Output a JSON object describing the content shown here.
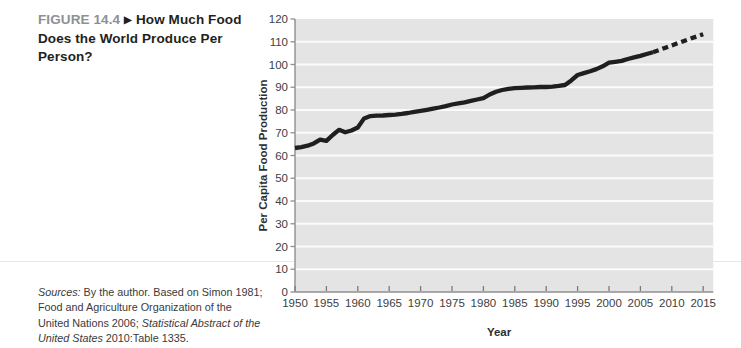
{
  "figure": {
    "label": "FIGURE 14.4",
    "arrow": "▶",
    "title": "How Much Food Does the World Produce Per Person?"
  },
  "sources": {
    "label_italic": "Sources:",
    "text_1": " By the author. Based on Simon 1981; Food and Agriculture Organization of the United Nations 2006; ",
    "italic_title": "Statistical Abstract of the United States",
    "text_2": " 2010:Table 1335."
  },
  "chart_data": {
    "type": "line",
    "title": "",
    "xlabel": "Year",
    "ylabel": "Per Capita Food Production",
    "xlim": [
      1950,
      2016.6
    ],
    "ylim": [
      0,
      120
    ],
    "x_ticks": [
      1950,
      1955,
      1960,
      1965,
      1970,
      1975,
      1980,
      1985,
      1990,
      1995,
      2000,
      2005,
      2010,
      2015
    ],
    "y_ticks": [
      0,
      10,
      20,
      30,
      40,
      50,
      60,
      70,
      80,
      90,
      100,
      110,
      120
    ],
    "grid": "horizontal white gridlines on light-gray plot band",
    "legend": "none",
    "series": [
      {
        "name": "historical",
        "style": "solid",
        "points": [
          [
            1950,
            63.3
          ],
          [
            1951,
            63.7
          ],
          [
            1952,
            64.3
          ],
          [
            1953,
            65.3
          ],
          [
            1954,
            67.0
          ],
          [
            1955,
            66.4
          ],
          [
            1956,
            69.0
          ],
          [
            1957,
            71.3
          ],
          [
            1958,
            70.2
          ],
          [
            1959,
            71.0
          ],
          [
            1960,
            72.3
          ],
          [
            1961,
            76.3
          ],
          [
            1962,
            77.3
          ],
          [
            1963,
            77.5
          ],
          [
            1964,
            77.6
          ],
          [
            1965,
            77.8
          ],
          [
            1966,
            78.0
          ],
          [
            1967,
            78.3
          ],
          [
            1968,
            78.7
          ],
          [
            1969,
            79.2
          ],
          [
            1970,
            79.6
          ],
          [
            1971,
            80.1
          ],
          [
            1972,
            80.6
          ],
          [
            1973,
            81.1
          ],
          [
            1974,
            81.7
          ],
          [
            1975,
            82.4
          ],
          [
            1976,
            82.9
          ],
          [
            1977,
            83.4
          ],
          [
            1978,
            84.0
          ],
          [
            1979,
            84.6
          ],
          [
            1980,
            85.2
          ],
          [
            1981,
            86.8
          ],
          [
            1982,
            88.0
          ],
          [
            1983,
            88.8
          ],
          [
            1984,
            89.3
          ],
          [
            1985,
            89.6
          ],
          [
            1986,
            89.7
          ],
          [
            1987,
            89.9
          ],
          [
            1988,
            90.0
          ],
          [
            1989,
            90.1
          ],
          [
            1990,
            90.1
          ],
          [
            1991,
            90.3
          ],
          [
            1992,
            90.6
          ],
          [
            1993,
            91.0
          ],
          [
            1994,
            93.0
          ],
          [
            1995,
            95.4
          ],
          [
            1996,
            96.2
          ],
          [
            1997,
            97.0
          ],
          [
            1998,
            98.0
          ],
          [
            1999,
            99.2
          ],
          [
            2000,
            100.8
          ],
          [
            2001,
            101.2
          ],
          [
            2002,
            101.6
          ],
          [
            2003,
            102.4
          ],
          [
            2004,
            103.1
          ],
          [
            2005,
            103.8
          ],
          [
            2006,
            104.6
          ],
          [
            2007,
            105.4
          ]
        ]
      },
      {
        "name": "projection",
        "style": "dashed",
        "points": [
          [
            2007,
            105.4
          ],
          [
            2009,
            107.4
          ],
          [
            2011,
            109.4
          ],
          [
            2013,
            111.4
          ],
          [
            2015,
            113.3
          ]
        ]
      }
    ],
    "colors": {
      "line": "#1f1f1f",
      "plot_bg": "#e4e4e4",
      "gridline": "#fbfbfb",
      "axis": "#8f8f8f",
      "tick_label": "#404040",
      "axis_title": "#2e2e2e",
      "figure_label": "#8e9093",
      "text": "#231f20"
    }
  }
}
